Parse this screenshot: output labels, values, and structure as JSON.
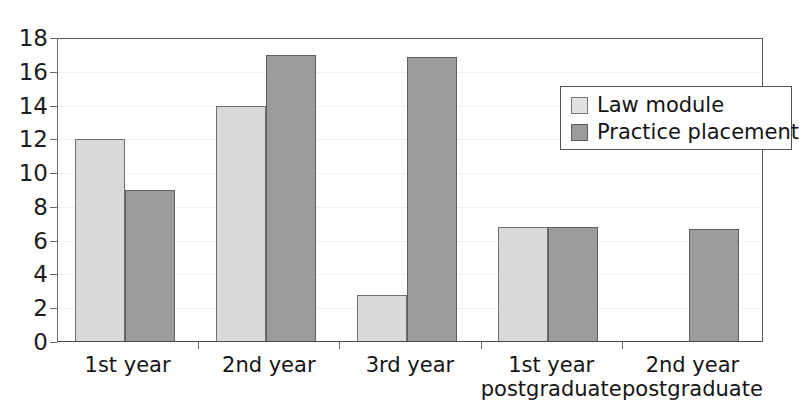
{
  "chart_data": {
    "type": "bar",
    "title": "",
    "xlabel": "",
    "ylabel": "",
    "ylim": [
      0,
      18
    ],
    "ytick_step": 2,
    "yticks": [
      "0",
      "2",
      "4",
      "6",
      "8",
      "10",
      "12",
      "14",
      "16",
      "18"
    ],
    "grid": true,
    "legend_position": "upper-right-inside",
    "categories": [
      "1st year",
      "2nd year",
      "3rd year",
      "1st year\npostgraduate",
      "2nd year\npostgraduate"
    ],
    "series": [
      {
        "name": "Law module",
        "color": "#d9d9d9",
        "values": [
          12,
          14,
          2.8,
          6.8,
          null
        ]
      },
      {
        "name": "Practice placement",
        "color": "#9c9c9c",
        "values": [
          9,
          17,
          16.9,
          6.8,
          6.7
        ]
      }
    ]
  },
  "legend": {
    "items": [
      {
        "label": "Law module",
        "swatch": "light"
      },
      {
        "label": "Practice placement",
        "swatch": "dark"
      }
    ]
  },
  "title_remnant": ""
}
